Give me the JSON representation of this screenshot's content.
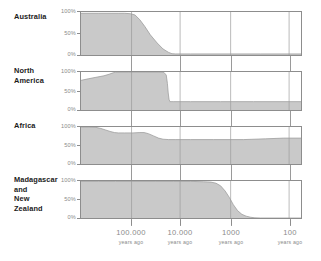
{
  "chart_data": {
    "type": "area",
    "title": "",
    "subtitle": "",
    "xlabel": "years ago",
    "ylabel": "",
    "x_axis": {
      "scale": "log-reversed",
      "tick_values": [
        100000,
        10000,
        1000,
        100
      ],
      "tick_labels": [
        "100.000",
        "10.000",
        "1000",
        "100"
      ],
      "tick_unit": "years ago",
      "x_min": 400000,
      "x_max": 60
    },
    "y_axis": {
      "tick_labels": [
        "100%",
        "50%",
        "0%"
      ],
      "tick_values": [
        100,
        50,
        0
      ],
      "ylim": [
        0,
        100
      ],
      "unit": "percent"
    },
    "grid": true,
    "legend": false,
    "legend_position": "none",
    "fill_color": "#c9c9c9",
    "line_color": "#8d8d8d",
    "frame_color": "#8d8d8d",
    "tick_text_color": "#8a8a8a",
    "label_text_color": "#1b1b1b",
    "series": [
      {
        "name": "Australia",
        "label_lines": [
          "Australia"
        ],
        "points": [
          [
            400000,
            97
          ],
          [
            200000,
            97
          ],
          [
            120000,
            97
          ],
          [
            90000,
            97
          ],
          [
            70000,
            97
          ],
          [
            55000,
            96
          ],
          [
            46000,
            93
          ],
          [
            38000,
            82
          ],
          [
            31000,
            66
          ],
          [
            25000,
            47
          ],
          [
            19000,
            28
          ],
          [
            15000,
            14
          ],
          [
            12000,
            6
          ],
          [
            10500,
            3
          ],
          [
            9000,
            2.5
          ],
          [
            5000,
            2.5
          ],
          [
            1000,
            2.5
          ],
          [
            300,
            2.5
          ],
          [
            60,
            2.5
          ]
        ]
      },
      {
        "name": "North America",
        "label_lines": [
          "North",
          "America"
        ],
        "points": [
          [
            400000,
            78
          ],
          [
            300000,
            82
          ],
          [
            220000,
            86
          ],
          [
            160000,
            90
          ],
          [
            130000,
            94
          ],
          [
            110000,
            98
          ],
          [
            100000,
            100
          ],
          [
            60000,
            100
          ],
          [
            30000,
            100
          ],
          [
            18000,
            100
          ],
          [
            14500,
            99
          ],
          [
            13200,
            92
          ],
          [
            12600,
            70
          ],
          [
            12200,
            45
          ],
          [
            11800,
            28
          ],
          [
            11400,
            22
          ],
          [
            10000,
            22
          ],
          [
            5000,
            22
          ],
          [
            1500,
            22
          ],
          [
            400,
            22
          ],
          [
            60,
            22
          ]
        ]
      },
      {
        "name": "Africa",
        "label_lines": [
          "Africa"
        ],
        "points": [
          [
            400000,
            100
          ],
          [
            300000,
            100
          ],
          [
            220000,
            99
          ],
          [
            180000,
            96
          ],
          [
            150000,
            92
          ],
          [
            125000,
            88
          ],
          [
            105000,
            85
          ],
          [
            90000,
            84
          ],
          [
            70000,
            84
          ],
          [
            50000,
            84
          ],
          [
            38000,
            85
          ],
          [
            32000,
            85
          ],
          [
            27000,
            82
          ],
          [
            22000,
            76
          ],
          [
            18000,
            70
          ],
          [
            15000,
            67
          ],
          [
            12000,
            66
          ],
          [
            9000,
            66
          ],
          [
            5000,
            66
          ],
          [
            2000,
            66
          ],
          [
            600,
            66
          ],
          [
            250,
            68
          ],
          [
            120,
            70
          ],
          [
            60,
            70
          ]
        ]
      },
      {
        "name": "Madagascar and New Zealand",
        "label_lines": [
          "Madagascar",
          "and",
          "New",
          "Zealand"
        ],
        "points": [
          [
            400000,
            99
          ],
          [
            200000,
            99
          ],
          [
            100000,
            99
          ],
          [
            50000,
            99
          ],
          [
            20000,
            99
          ],
          [
            10000,
            99
          ],
          [
            5000,
            99
          ],
          [
            3000,
            98
          ],
          [
            2200,
            97
          ],
          [
            1800,
            94
          ],
          [
            1500,
            87
          ],
          [
            1250,
            73
          ],
          [
            1050,
            55
          ],
          [
            900,
            36
          ],
          [
            760,
            20
          ],
          [
            640,
            10
          ],
          [
            540,
            5
          ],
          [
            450,
            2
          ],
          [
            380,
            0.5
          ],
          [
            300,
            0
          ],
          [
            150,
            0
          ],
          [
            60,
            0
          ]
        ]
      }
    ]
  },
  "panels": [
    {
      "label_lines": [
        "Australia"
      ],
      "series_index": 0
    },
    {
      "label_lines": [
        "North",
        "America"
      ],
      "series_index": 1
    },
    {
      "label_lines": [
        "Africa"
      ],
      "series_index": 2
    },
    {
      "label_lines": [
        "Madagascar",
        "and",
        "New",
        "Zealand"
      ],
      "series_index": 3
    }
  ],
  "y_ticks": [
    "100%",
    "50%",
    "0%"
  ],
  "x_ticks": [
    {
      "value": "100.000",
      "unit": "years ago"
    },
    {
      "value": "10.000",
      "unit": "years ago"
    },
    {
      "value": "1000",
      "unit": "years ago"
    },
    {
      "value": "100",
      "unit": "years ago"
    }
  ]
}
